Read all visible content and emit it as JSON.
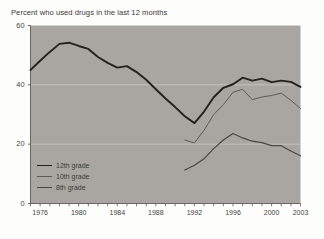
{
  "chart_data": {
    "type": "line",
    "title": "Percent who used drugs in the last 12 months",
    "xlabel": "",
    "ylabel": "",
    "xlim": [
      1975,
      2003
    ],
    "ylim": [
      0,
      60
    ],
    "yticks": [
      0,
      20,
      40,
      60
    ],
    "ytick_labels": [
      "0",
      "20",
      "40",
      "60"
    ],
    "xticks": [
      1976,
      1980,
      1984,
      1988,
      1992,
      1996,
      2000,
      2003
    ],
    "xtick_labels": [
      "1976",
      "1980",
      "1984",
      "1988",
      "1992",
      "1996",
      "2000",
      "2003"
    ],
    "grid": true,
    "grid_axis": "y",
    "legend_position": "lower left",
    "plot_bgcolor": "#a9a6a1",
    "figure_bgcolor": "#fdfdfc",
    "series": [
      {
        "name": "12th grade",
        "color": "#24221f",
        "width": 1.9,
        "x": [
          1975,
          1976,
          1977,
          1978,
          1979,
          1980,
          1981,
          1982,
          1983,
          1984,
          1985,
          1986,
          1987,
          1988,
          1989,
          1990,
          1991,
          1992,
          1993,
          1994,
          1995,
          1996,
          1997,
          1998,
          1999,
          2000,
          2001,
          2002,
          2003
        ],
        "values": [
          45.0,
          48.1,
          51.1,
          53.8,
          54.2,
          53.1,
          52.1,
          49.4,
          47.4,
          45.8,
          46.3,
          44.3,
          41.7,
          38.5,
          35.4,
          32.5,
          29.4,
          27.1,
          31.0,
          35.8,
          39.0,
          40.2,
          42.4,
          41.4,
          42.1,
          40.9,
          41.4,
          41.0,
          39.3
        ],
        "style": "solid"
      },
      {
        "name": "10th grade",
        "color": "#5e5b56",
        "width": 1.0,
        "x": [
          1991,
          1992,
          1993,
          1994,
          1995,
          1996,
          1997,
          1998,
          1999,
          2000,
          2001,
          2002,
          2003
        ],
        "values": [
          21.4,
          20.4,
          24.7,
          30.0,
          33.3,
          37.5,
          38.5,
          35.0,
          35.9,
          36.4,
          37.2,
          34.8,
          32.0
        ],
        "style": "solid"
      },
      {
        "name": "8th grade",
        "color": "#4a4742",
        "width": 1.2,
        "x": [
          1991,
          1992,
          1993,
          1994,
          1995,
          1996,
          1997,
          1998,
          1999,
          2000,
          2001,
          2002,
          2003
        ],
        "values": [
          11.3,
          12.9,
          15.1,
          18.5,
          21.4,
          23.6,
          22.1,
          21.0,
          20.5,
          19.5,
          19.5,
          17.7,
          16.1
        ],
        "style": "solid"
      }
    ]
  },
  "legend": {
    "items": [
      {
        "label": "12th grade"
      },
      {
        "label": "10th grade"
      },
      {
        "label": "8th grade"
      }
    ]
  }
}
